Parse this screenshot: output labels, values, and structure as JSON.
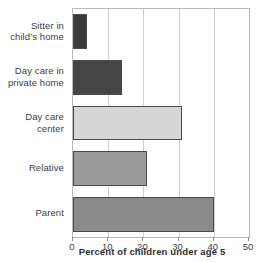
{
  "chart_data": {
    "type": "bar",
    "orientation": "horizontal",
    "title": "",
    "xlabel": "Percent of children under age 5",
    "ylabel": "",
    "xlim": [
      0,
      50
    ],
    "xticks": [
      0,
      10,
      20,
      30,
      40,
      50
    ],
    "xticklabels": [
      "0",
      "10",
      "20",
      "30",
      "40",
      "50"
    ],
    "grid": "vertical",
    "legend": "none",
    "categories": [
      "Sitter in\nchild’s home",
      "Day care in\nprivate home",
      "Day care center",
      "Relative",
      "Parent"
    ],
    "values": [
      4,
      14,
      31,
      21,
      40
    ],
    "bar_colors": [
      "#3a3a3a",
      "#454545",
      "#d6d6d6",
      "#9a9a9a",
      "#8b8b8b"
    ],
    "bar_edge_color": "#4a4a4a",
    "grid_color": "#cfcfcf",
    "frame_color": "#b9b9b9",
    "text_color": "#3d3d3d",
    "background": "#ffffff"
  }
}
